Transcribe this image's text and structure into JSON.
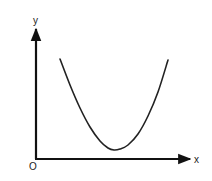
{
  "chart_data": {
    "type": "line",
    "title": "",
    "xlabel": "x",
    "ylabel": "y",
    "origin_label": "O",
    "grid": false,
    "legend": null,
    "series": [
      {
        "name": "curve",
        "points_px": [
          [
            60,
            59
          ],
          [
            70,
            85
          ],
          [
            80,
            108
          ],
          [
            90,
            127
          ],
          [
            100,
            141
          ],
          [
            108,
            148
          ],
          [
            114,
            150
          ],
          [
            120,
            149
          ],
          [
            128,
            145
          ],
          [
            138,
            134
          ],
          [
            148,
            116
          ],
          [
            158,
            92
          ],
          [
            168,
            60
          ]
        ]
      }
    ],
    "colors": {
      "axis": "#111111",
      "curve": "#222222",
      "background": "#ffffff"
    }
  },
  "labels": {
    "x": "x",
    "y": "y",
    "origin": "O"
  }
}
